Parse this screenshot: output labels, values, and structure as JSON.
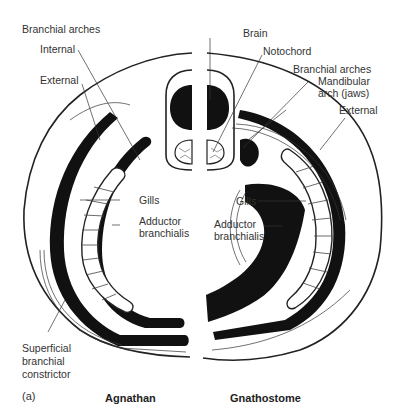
{
  "figure": {
    "panel_label": "(a)",
    "left_title": "Agnathan",
    "right_title": "Gnathostome"
  },
  "labels": {
    "branchial_arches_left": "Branchial arches",
    "internal": "Internal",
    "external_left": "External",
    "gills_left": "Gills",
    "adductor_left_1": "Adductor",
    "adductor_left_2": "branchialis",
    "superficial_1": "Superficial",
    "superficial_2": "branchial",
    "superficial_3": "constrictor",
    "brain": "Brain",
    "notochord": "Notochord",
    "branchial_arches_right": "Branchial arches",
    "mandibular_1": "Mandibular",
    "mandibular_2": "arch (jaws)",
    "external_right": "External",
    "gills_right": "Gills",
    "adductor_right_1": "Adductor",
    "adductor_right_2": "branchialis"
  }
}
